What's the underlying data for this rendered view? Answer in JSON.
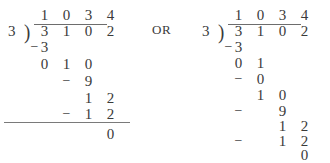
{
  "worksheet": {
    "connector_label": "OR",
    "divisions": [
      {
        "id": "division-left",
        "divisor": "3",
        "bracket": ")",
        "quotient": [
          "1",
          "0",
          "3",
          "4"
        ],
        "dividend": [
          "3",
          "1",
          "0",
          "2"
        ],
        "steps": [
          {
            "minus": "−",
            "digits": [
              "3"
            ]
          },
          {
            "minus": "",
            "digits": [
              "0",
              "1",
              "0"
            ]
          },
          {
            "minus": "−",
            "digits": [
              "9"
            ]
          },
          {
            "minus": "",
            "digits": [
              "1",
              "2"
            ]
          },
          {
            "minus": "−",
            "digits": [
              "1",
              "2"
            ]
          },
          {
            "minus": "",
            "digits": [
              "0"
            ]
          }
        ],
        "remainder": "0",
        "has_base_rule": true
      },
      {
        "id": "division-right",
        "divisor": "3",
        "bracket": ")",
        "quotient": [
          "1",
          "0",
          "3",
          "4"
        ],
        "dividend": [
          "3",
          "1",
          "0",
          "2"
        ],
        "steps": [
          {
            "minus": "−",
            "digits": [
              "3"
            ]
          },
          {
            "minus": "",
            "digits": [
              "0",
              "1"
            ]
          },
          {
            "minus": "−",
            "digits": [
              "0"
            ]
          },
          {
            "minus": "",
            "digits": [
              "1",
              "0"
            ]
          },
          {
            "minus": "−",
            "digits": [
              "9"
            ]
          },
          {
            "minus": "",
            "digits": [
              "1",
              "2"
            ]
          },
          {
            "minus": "−",
            "digits": [
              "1",
              "2"
            ]
          },
          {
            "minus": "",
            "digits": [
              "0"
            ]
          }
        ],
        "remainder": "0",
        "has_base_rule": false
      }
    ]
  },
  "layout": {
    "left": {
      "divisor_x": 8,
      "divisor_y": 24,
      "bracket_x": 24,
      "bracket_y": 21,
      "col_x": [
        36,
        58,
        80,
        102
      ],
      "quotient_y": 8,
      "vinculum_x": 34,
      "vinculum_y": 24,
      "vinculum_w": 73,
      "dividend_y": 24,
      "rows": [
        {
          "y": 40,
          "minus_col": -1,
          "start_col": 0
        },
        {
          "y": 57,
          "minus_col": -1,
          "start_col": 0
        },
        {
          "y": 74,
          "minus_col": 1,
          "start_col": 2
        },
        {
          "y": 91,
          "minus_col": -1,
          "start_col": 2
        },
        {
          "y": 107,
          "minus_col": 1,
          "start_col": 2
        },
        {
          "y": 127,
          "minus_col": -1,
          "start_col": 3
        }
      ],
      "minus_x": [
        36,
        58,
        80,
        102
      ],
      "baserule_x": 4,
      "baserule_y": 122,
      "baserule_w": 126
    },
    "right": {
      "divisor_x": 6,
      "divisor_y": 24,
      "bracket_x": 22,
      "bracket_y": 21,
      "col_x": [
        34,
        56,
        78,
        100
      ],
      "quotient_y": 8,
      "vinculum_x": 32,
      "vinculum_y": 24,
      "vinculum_w": 73,
      "dividend_y": 24,
      "rows": [
        {
          "y": 40,
          "minus_col": -1,
          "start_col": 0
        },
        {
          "y": 56,
          "minus_col": -1,
          "start_col": 0
        },
        {
          "y": 72,
          "minus_col": 0,
          "start_col": 1
        },
        {
          "y": 88,
          "minus_col": -1,
          "start_col": 1
        },
        {
          "y": 104,
          "minus_col": 0,
          "start_col": 2
        },
        {
          "y": 119,
          "minus_col": -1,
          "start_col": 2
        },
        {
          "y": 134,
          "minus_col": 0,
          "start_col": 2
        },
        {
          "y": 148,
          "minus_col": -1,
          "start_col": 3
        }
      ],
      "minus_x": [
        34,
        56,
        78,
        100
      ],
      "baserule_x": 0,
      "baserule_y": 0,
      "baserule_w": 0
    }
  }
}
